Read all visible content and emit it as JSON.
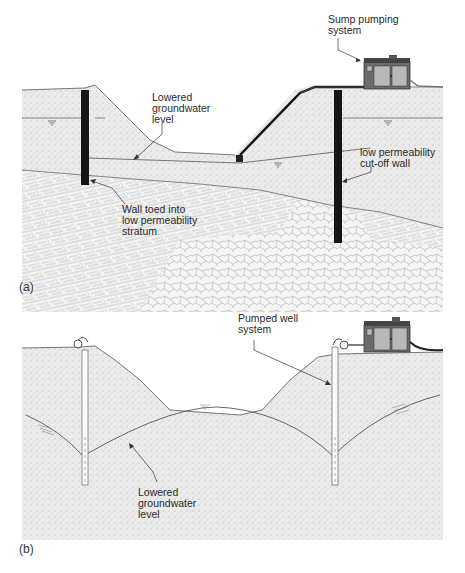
{
  "figure": {
    "panels": [
      {
        "id": "a",
        "tag": "(a)",
        "labels": {
          "sump": "Sump pumping\nsystem",
          "lowered_left": "Lowered\ngroundwater\nlevel",
          "cutoff": "low permeability\ncut-off wall",
          "toed": "Wall toed into\nlow permeability\nstratum"
        }
      },
      {
        "id": "b",
        "tag": "(b)",
        "labels": {
          "well": "Pumped well\nsystem",
          "lowered": "Lowered\ngroundwater\nlevel"
        }
      }
    ],
    "colors": {
      "soil_fill": "#e9e9e9",
      "rock_lines": "#9a9a9a",
      "wall": "#1a1a1a",
      "line": "#444444",
      "pump_body": "#6b6b6b"
    }
  }
}
